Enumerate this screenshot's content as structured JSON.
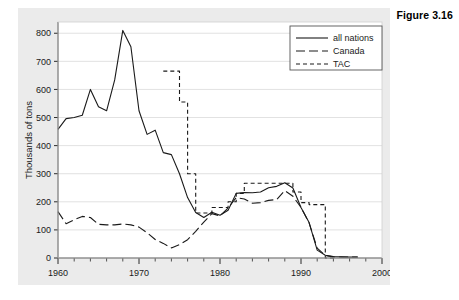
{
  "figure": {
    "caption": "Figure 3.16"
  },
  "chart_data": {
    "type": "line",
    "title": "",
    "xlabel": "",
    "ylabel": "Thousands of tons",
    "xlim": [
      1960,
      2000
    ],
    "ylim": [
      0,
      840
    ],
    "xticks": [
      1960,
      1970,
      1980,
      1990,
      2000
    ],
    "xtick_labels": [
      "1960",
      "1970",
      "1980",
      "1990",
      "2000"
    ],
    "xminor_step": 2,
    "yticks": [
      0,
      100,
      200,
      300,
      400,
      500,
      600,
      700,
      800
    ],
    "ytick_labels": [
      "0",
      "100",
      "200",
      "300",
      "400",
      "500",
      "600",
      "700",
      "800"
    ],
    "grid": "horizontal",
    "grid_color": "#d9d9d9",
    "plot_background": "#ffffff",
    "panel_background": "#ebebeb",
    "line_color": "#1a1a1a",
    "legend_position": "top-right",
    "series": [
      {
        "name": "all nations",
        "style": "solid",
        "dasharray": "",
        "x": [
          1960,
          1961,
          1962,
          1963,
          1964,
          1965,
          1966,
          1967,
          1968,
          1969,
          1970,
          1971,
          1972,
          1973,
          1974,
          1975,
          1976,
          1977,
          1978,
          1979,
          1980,
          1981,
          1982,
          1983,
          1984,
          1985,
          1986,
          1987,
          1988,
          1989,
          1990,
          1991,
          1992,
          1993,
          1994,
          1995,
          1996,
          1997
        ],
        "values": [
          458,
          496,
          500,
          508,
          600,
          538,
          524,
          634,
          810,
          752,
          524,
          440,
          455,
          375,
          368,
          300,
          215,
          162,
          144,
          163,
          152,
          170,
          230,
          233,
          232,
          235,
          250,
          255,
          268,
          249,
          180,
          126,
          28,
          10,
          5,
          4,
          3,
          3
        ]
      },
      {
        "name": "Canada",
        "style": "long-dash",
        "dasharray": "9,4",
        "x": [
          1960,
          1961,
          1962,
          1963,
          1964,
          1965,
          1966,
          1967,
          1968,
          1969,
          1970,
          1971,
          1972,
          1973,
          1974,
          1975,
          1976,
          1977,
          1978,
          1979,
          1980,
          1981,
          1982,
          1983,
          1984,
          1985,
          1986,
          1987,
          1988,
          1989,
          1990,
          1991,
          1992,
          1993,
          1994,
          1995,
          1996,
          1997
        ],
        "values": [
          165,
          122,
          136,
          148,
          144,
          120,
          118,
          118,
          121,
          118,
          110,
          90,
          66,
          52,
          36,
          48,
          65,
          95,
          128,
          158,
          150,
          178,
          215,
          210,
          195,
          197,
          205,
          208,
          240,
          220,
          180,
          125,
          35,
          9,
          4,
          3,
          3,
          3
        ]
      },
      {
        "name": "TAC",
        "style": "short-dash",
        "dasharray": "4,3",
        "step": true,
        "x": [
          1973,
          1974,
          1975,
          1976,
          1977,
          1978,
          1979,
          1980,
          1981,
          1982,
          1983,
          1984,
          1985,
          1986,
          1987,
          1988,
          1989,
          1990,
          1991,
          1992,
          1993
        ],
        "values": [
          665,
          665,
          555,
          300,
          160,
          160,
          180,
          180,
          200,
          230,
          266,
          266,
          266,
          266,
          266,
          266,
          235,
          197,
          190,
          190,
          0
        ]
      }
    ]
  },
  "legend": {
    "items": [
      {
        "label": "all nations",
        "style": "solid"
      },
      {
        "label": "Canada",
        "style": "long-dash"
      },
      {
        "label": "TAC",
        "style": "short-dash"
      }
    ]
  }
}
